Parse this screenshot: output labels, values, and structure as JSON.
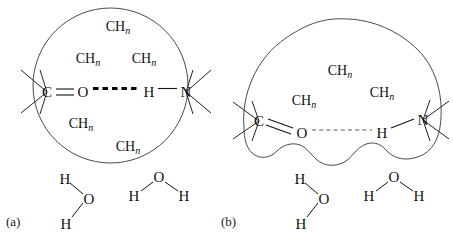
{
  "figure": {
    "background_color": "#ffffff",
    "ink_color": "#111111",
    "envelope_color": "#4a4a4a"
  },
  "panels": [
    {
      "id": "a",
      "label": "(a)",
      "envelope_shape": "circle",
      "description": "Intact hydrophobic sphere with a strong buried hydrogen bond",
      "hydrogen_bond": {
        "style": "thick-dashed",
        "strength": "strong",
        "color": "#000000",
        "donor": "H",
        "acceptor": "O"
      },
      "atoms": [
        {
          "symbol": "C",
          "x": 47,
          "y": 92
        },
        {
          "symbol": "O",
          "x": 83,
          "y": 92
        },
        {
          "symbol": "H",
          "x": 149,
          "y": 92
        },
        {
          "symbol": "N",
          "x": 186,
          "y": 92
        }
      ],
      "chn_groups": [
        {
          "text": "CH",
          "sub": "n",
          "x": 118,
          "y": 26
        },
        {
          "text": "CH",
          "sub": "n",
          "x": 88,
          "y": 58
        },
        {
          "text": "CH",
          "sub": "n",
          "x": 144,
          "y": 58
        },
        {
          "text": "CH",
          "sub": "n",
          "x": 81,
          "y": 123
        },
        {
          "text": "CH",
          "sub": "n",
          "x": 128,
          "y": 146
        }
      ],
      "water_molecules": [
        {
          "id": "water-left",
          "oxygen": {
            "symbol": "O",
            "x": 89,
            "y": 199
          },
          "hydrogens": [
            {
              "symbol": "H",
              "x": 65,
              "y": 179
            },
            {
              "symbol": "H",
              "x": 66,
              "y": 224
            }
          ]
        },
        {
          "id": "water-right",
          "oxygen": {
            "symbol": "O",
            "x": 159,
            "y": 177
          },
          "hydrogens": [
            {
              "symbol": "H",
              "x": 134,
              "y": 196
            },
            {
              "symbol": "H",
              "x": 184,
              "y": 196
            }
          ]
        }
      ]
    },
    {
      "id": "b",
      "label": "(b)",
      "envelope_shape": "notched-blob",
      "description": "Water-penetrated core with notches; the hydrogen bond is weakened",
      "hydrogen_bond": {
        "style": "thin-dashed",
        "strength": "weak",
        "color": "#5a5a6a",
        "donor": "H",
        "acceptor": "O"
      },
      "atoms": [
        {
          "symbol": "C",
          "x": 259,
          "y": 121
        },
        {
          "symbol": "O",
          "x": 302,
          "y": 133
        },
        {
          "symbol": "H",
          "x": 382,
          "y": 133
        },
        {
          "symbol": "N",
          "x": 423,
          "y": 120
        }
      ],
      "chn_groups": [
        {
          "text": "CH",
          "sub": "n",
          "x": 340,
          "y": 70
        },
        {
          "text": "CH",
          "sub": "n",
          "x": 382,
          "y": 92
        },
        {
          "text": "CH",
          "sub": "n",
          "x": 304,
          "y": 100
        }
      ],
      "water_molecules": [
        {
          "id": "water-left",
          "oxygen": {
            "symbol": "O",
            "x": 324,
            "y": 199
          },
          "hydrogens": [
            {
              "symbol": "H",
              "x": 300,
              "y": 179
            },
            {
              "symbol": "H",
              "x": 301,
              "y": 224
            }
          ]
        },
        {
          "id": "water-right",
          "oxygen": {
            "symbol": "O",
            "x": 394,
            "y": 177
          },
          "hydrogens": [
            {
              "symbol": "H",
              "x": 369,
              "y": 196
            },
            {
              "symbol": "H",
              "x": 419,
              "y": 196
            }
          ]
        }
      ]
    }
  ]
}
